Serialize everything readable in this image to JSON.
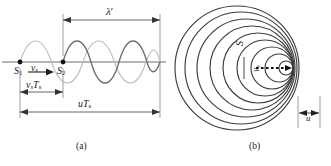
{
  "figure": {
    "title_caption_a": "(a)",
    "title_caption_b": "(b)",
    "topic": "Doppler effect of a moving sound source"
  },
  "panel_a": {
    "caption": "(a)",
    "labels": {
      "wavelength_primed": "λ′",
      "wavelength_primed_base": "λ",
      "wavelength_prime_mark": "′",
      "source1": "S",
      "source1_sub": "1",
      "source2": "S",
      "source2_sub": "2",
      "velocity_source": "v",
      "velocity_source_sub": "s",
      "source_displacement": "v",
      "source_displacement_sub": "s",
      "source_displacement_period": "T",
      "source_displacement_period_sub": "s",
      "wave_distance": "u",
      "wave_distance_period": "T",
      "wave_distance_period_sub": "s"
    },
    "points": [
      {
        "name": "S1",
        "x": 20,
        "y": 62
      },
      {
        "name": "S2",
        "x": 63,
        "y": 62
      }
    ],
    "dimensions": [
      {
        "name": "lambda-prime",
        "from_x": 63,
        "to_x": 160,
        "y": 20
      },
      {
        "name": "vs-Ts",
        "from_x": 20,
        "to_x": 63,
        "y": 92
      },
      {
        "name": "u-Ts",
        "from_x": 20,
        "to_x": 160,
        "y": 112
      }
    ],
    "waves": [
      {
        "name": "wave-from-S1",
        "start_x": 20,
        "end_x": 160,
        "style": "light-gray",
        "amplitude": 28
      },
      {
        "name": "wave-from-S2",
        "start_x": 63,
        "end_x": 160,
        "style": "dark-gray",
        "amplitude": 28
      }
    ],
    "axis": {
      "y": 62,
      "from_x": 2,
      "to_x": 166
    }
  },
  "panel_b": {
    "caption": "(b)",
    "labels": {
      "source": "S",
      "velocity_source": "v",
      "velocity_source_sub": "s",
      "wave_speed": "u"
    },
    "wavefronts": {
      "count": 9,
      "outermost_radius": 62,
      "center_x": 238,
      "center_y": 68,
      "eccentric_shift_per_ring": 6.6,
      "description": "concentric circles bunched on the right side"
    },
    "source_arrow": {
      "name": "dotted-motion-arrow",
      "from_x": 256,
      "to_x": 292,
      "y": 68
    },
    "u_dimension": {
      "name": "u-gap",
      "from_x": 300,
      "to_x": 318,
      "y": 114
    }
  },
  "colors": {
    "ink": "#1a1a1a",
    "wave_dark": "#6a6a6a",
    "wave_light": "#b3b3b3",
    "rule": "#555555"
  }
}
